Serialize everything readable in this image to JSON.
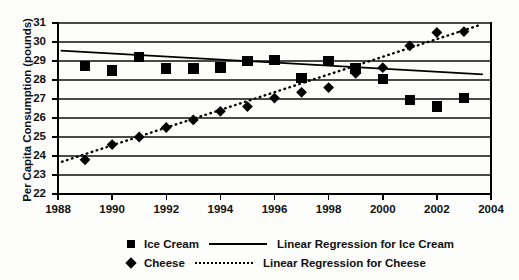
{
  "chart_data": {
    "type": "scatter",
    "title": "",
    "xlabel": "",
    "ylabel": "Per Capita Consumption (pounds)",
    "xlim": [
      1988,
      2004
    ],
    "ylim": [
      22,
      31
    ],
    "ytick_step": 1,
    "xtick_step": 2,
    "grid": "horizontal",
    "legend_position": "bottom",
    "xticks": [
      "1988",
      "1990",
      "1992",
      "1994",
      "1996",
      "1998",
      "2000",
      "2002",
      "2004"
    ],
    "yticks": [
      "22",
      "23",
      "24",
      "25",
      "26",
      "27",
      "28",
      "29",
      "30",
      "31"
    ],
    "series": [
      {
        "name": "Ice Cream",
        "marker": "square",
        "color": "#000000",
        "x": [
          1989,
          1990,
          1991,
          1992,
          1993,
          1994,
          1995,
          1996,
          1997,
          1998,
          1999,
          2000,
          2001,
          2002,
          2003
        ],
        "values": [
          28.75,
          28.5,
          29.2,
          28.6,
          28.6,
          28.65,
          29.0,
          29.05,
          28.1,
          29.0,
          28.6,
          28.05,
          26.95,
          26.6,
          27.05
        ]
      },
      {
        "name": "Cheese",
        "marker": "diamond",
        "color": "#000000",
        "x": [
          1989,
          1990,
          1991,
          1992,
          1993,
          1994,
          1995,
          1996,
          1997,
          1998,
          1999,
          2000,
          2001,
          2002,
          2003
        ],
        "values": [
          23.8,
          24.6,
          25.0,
          25.5,
          25.9,
          26.35,
          26.6,
          27.05,
          27.35,
          27.6,
          28.35,
          28.65,
          29.8,
          30.5,
          30.55
        ]
      }
    ],
    "trendlines": [
      {
        "name": "Linear Regression for Ice Cream",
        "style": "solid",
        "color": "#000000",
        "x_start": 1988.1,
        "y_start": 29.55,
        "x_end": 2003.7,
        "y_end": 28.3
      },
      {
        "name": "Linear Regression for Cheese",
        "style": "dotted",
        "color": "#000000",
        "x_start": 1988.15,
        "y_start": 23.7,
        "x_end": 2003.6,
        "y_end": 30.9
      }
    ],
    "legend": [
      {
        "label": "Ice Cream",
        "marker": "square"
      },
      {
        "label": "Linear Regression for Ice Cream",
        "marker": "solid-line"
      },
      {
        "label": "Cheese",
        "marker": "diamond"
      },
      {
        "label": "Linear Regression for Cheese",
        "marker": "dotted-line"
      }
    ]
  }
}
